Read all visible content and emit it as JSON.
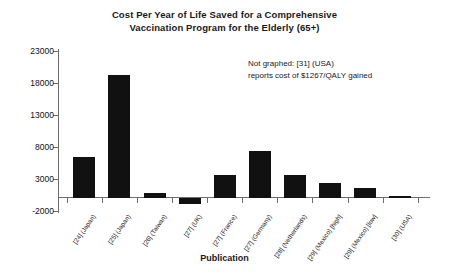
{
  "chart_data": {
    "type": "bar",
    "title": "Cost Per Year of Life Saved for a Comprehensive Vaccination Program for the Elderly (65+)",
    "title_lines": [
      "Cost Per Year of Life Saved for a Comprehensive",
      "Vaccination Program for the Elderly (65+)"
    ],
    "xlabel": "Publication",
    "ylabel": "",
    "ylim": [
      -2000,
      23000
    ],
    "ytick_values": [
      23000,
      18000,
      13000,
      8000,
      3000,
      -2000
    ],
    "ytick_labels": [
      "23000",
      "18000",
      "13000",
      "8000",
      "3000",
      "-2000"
    ],
    "grid": false,
    "legend": "none",
    "bar_color": "#111111",
    "categories": [
      "[24] (Japan)",
      "[25] (Japan)",
      "[26] (Taiwan)",
      "[27] (UK)",
      "[27] (France)",
      "[27] (Germany)",
      "[28] (Netherlands)",
      "[29] (Mexico) [high]",
      "[29] (Mexico) [low]",
      "[30] (USA)"
    ],
    "values": [
      6500,
      19200,
      800,
      -900,
      3600,
      7300,
      3600,
      2300,
      1600,
      400
    ],
    "annotations": [
      "Not graphed: [31] (USA)",
      "reports cost of $1267/QALY gained"
    ]
  }
}
